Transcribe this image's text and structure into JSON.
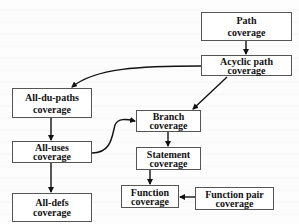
{
  "diagram": {
    "type": "subsumption-hierarchy",
    "nodes": [
      {
        "id": "path",
        "line1": "Path",
        "line2": "coverage"
      },
      {
        "id": "acyclic",
        "line1": "Acyclic path",
        "line2": "coverage"
      },
      {
        "id": "alldupaths",
        "line1": "All-du-paths",
        "line2": "coverage"
      },
      {
        "id": "alluses",
        "line1": "All-uses",
        "line2": "coverage"
      },
      {
        "id": "alldefs",
        "line1": "All-defs",
        "line2": "coverage"
      },
      {
        "id": "branch",
        "line1": "Branch",
        "line2": "coverage"
      },
      {
        "id": "statement",
        "line1": "Statement",
        "line2": "coverage"
      },
      {
        "id": "function",
        "line1": "Function",
        "line2": "coverage"
      },
      {
        "id": "functionpair",
        "line1": "Function pair",
        "line2": "coverage"
      }
    ],
    "edges": [
      {
        "from": "path",
        "to": "acyclic"
      },
      {
        "from": "acyclic",
        "to": "alldupaths"
      },
      {
        "from": "acyclic",
        "to": "branch"
      },
      {
        "from": "alldupaths",
        "to": "alluses"
      },
      {
        "from": "alluses",
        "to": "alldefs"
      },
      {
        "from": "alluses",
        "to": "branch"
      },
      {
        "from": "branch",
        "to": "statement"
      },
      {
        "from": "statement",
        "to": "function"
      },
      {
        "from": "functionpair",
        "to": "function"
      }
    ],
    "colors": {
      "box_border": "#555555",
      "box_fill": "#ffffff",
      "arrow": "#111111",
      "text": "#111111"
    }
  }
}
